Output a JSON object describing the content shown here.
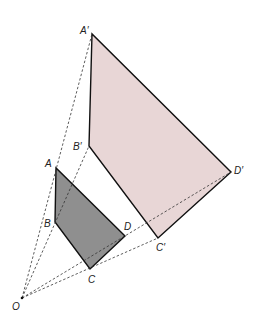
{
  "diagram": {
    "colors": {
      "image_fill": "#e8d6d6",
      "object_fill": "#8f8f8f",
      "edge": "#111111",
      "ray": "#333333"
    },
    "centre": {
      "label": "O",
      "x": 22,
      "y": 298
    },
    "object": {
      "A": {
        "label": "A",
        "x": 56,
        "y": 168
      },
      "B": {
        "label": "B",
        "x": 55,
        "y": 222
      },
      "C": {
        "label": "C",
        "x": 90,
        "y": 269
      },
      "D": {
        "label": "D",
        "x": 125,
        "y": 236
      }
    },
    "image": {
      "A": {
        "label": "A′",
        "x": 92,
        "y": 34
      },
      "B": {
        "label": "B′",
        "x": 89,
        "y": 146
      },
      "C": {
        "label": "C′",
        "x": 158,
        "y": 238
      },
      "D": {
        "label": "D′",
        "x": 231,
        "y": 172
      }
    }
  }
}
